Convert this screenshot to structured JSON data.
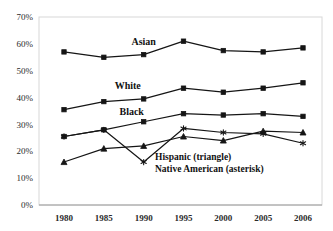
{
  "chart_data": {
    "type": "line",
    "title": "",
    "xlabel": "",
    "ylabel": "",
    "categories": [
      "1980",
      "1985",
      "1990",
      "1995",
      "2000",
      "2005",
      "2006"
    ],
    "ylim": [
      0,
      70
    ],
    "ytick_labels": [
      "0%",
      "10%",
      "20%",
      "30%",
      "40%",
      "50%",
      "60%",
      "70%"
    ],
    "ytick_values": [
      0,
      10,
      20,
      30,
      40,
      50,
      60,
      70
    ],
    "grid": false,
    "legend_position": "inline",
    "series": [
      {
        "name": "Asian",
        "marker": "square",
        "label_text": "Asian",
        "values": [
          57,
          55,
          56,
          61,
          57.5,
          57,
          58.5
        ]
      },
      {
        "name": "White",
        "marker": "square",
        "label_text": "White",
        "values": [
          35.5,
          38.5,
          39.5,
          43.5,
          42,
          43.5,
          45.5
        ]
      },
      {
        "name": "Black",
        "marker": "square",
        "label_text": "Black",
        "values": [
          25.5,
          28,
          31,
          34,
          33.5,
          34,
          33
        ]
      },
      {
        "name": "Hispanic",
        "marker": "triangle",
        "label_text": "",
        "values": [
          16,
          21,
          22,
          25.5,
          24,
          27.5,
          27
        ]
      },
      {
        "name": "Native American",
        "marker": "asterisk",
        "label_text": "",
        "values": [
          25.5,
          28,
          16,
          28.5,
          27,
          26.5,
          23
        ]
      }
    ],
    "annotations": [
      {
        "text": "Asian",
        "series": "Asian"
      },
      {
        "text": "White",
        "series": "White"
      },
      {
        "text": "Black",
        "series": "Black"
      }
    ],
    "legend_entries": [
      {
        "text": "Hispanic (triangle)"
      },
      {
        "text": "Native American (asterisk)"
      }
    ],
    "colors": {
      "line": "#151515",
      "marker": "#151515",
      "text": "#2b2b2b",
      "frame": "#d8d8d8",
      "background": "#ffffff"
    }
  }
}
